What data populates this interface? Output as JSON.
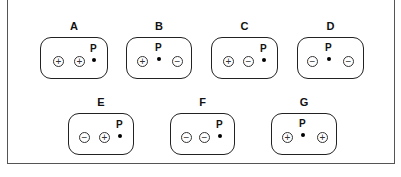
{
  "diagram": {
    "point_label": "P",
    "panels": [
      {
        "id": "A",
        "label": "A",
        "left": 40,
        "top": 37,
        "width": 68,
        "height": 42,
        "charges": [
          {
            "sign": "+",
            "x": 12,
            "y": 18
          },
          {
            "sign": "+",
            "x": 33,
            "y": 18
          }
        ],
        "p": {
          "x": 51,
          "y": 5
        }
      },
      {
        "id": "B",
        "label": "B",
        "left": 126,
        "top": 37,
        "width": 66,
        "height": 42,
        "charges": [
          {
            "sign": "+",
            "x": 10,
            "y": 18
          },
          {
            "sign": "−",
            "x": 45,
            "y": 18
          }
        ],
        "p": {
          "x": 30,
          "y": 4
        }
      },
      {
        "id": "C",
        "label": "C",
        "left": 211,
        "top": 37,
        "width": 67,
        "height": 42,
        "charges": [
          {
            "sign": "+",
            "x": 11,
            "y": 18
          },
          {
            "sign": "−",
            "x": 31,
            "y": 18
          }
        ],
        "p": {
          "x": 50,
          "y": 5
        }
      },
      {
        "id": "D",
        "label": "D",
        "left": 297,
        "top": 37,
        "width": 67,
        "height": 42,
        "charges": [
          {
            "sign": "−",
            "x": 9,
            "y": 18
          },
          {
            "sign": "−",
            "x": 45,
            "y": 18
          }
        ],
        "p": {
          "x": 29,
          "y": 4
        }
      },
      {
        "id": "E",
        "label": "E",
        "left": 68,
        "top": 113,
        "width": 66,
        "height": 42,
        "charges": [
          {
            "sign": "−",
            "x": 10,
            "y": 18
          },
          {
            "sign": "+",
            "x": 30,
            "y": 18
          }
        ],
        "p": {
          "x": 49,
          "y": 5
        }
      },
      {
        "id": "F",
        "label": "F",
        "left": 170,
        "top": 113,
        "width": 65,
        "height": 42,
        "charges": [
          {
            "sign": "−",
            "x": 10,
            "y": 18
          },
          {
            "sign": "−",
            "x": 28,
            "y": 18
          }
        ],
        "p": {
          "x": 47,
          "y": 5
        }
      },
      {
        "id": "G",
        "label": "G",
        "left": 271,
        "top": 113,
        "width": 66,
        "height": 42,
        "charges": [
          {
            "sign": "+",
            "x": 10,
            "y": 18
          },
          {
            "sign": "+",
            "x": 45,
            "y": 18
          }
        ],
        "p": {
          "x": 29,
          "y": 4
        }
      }
    ]
  }
}
